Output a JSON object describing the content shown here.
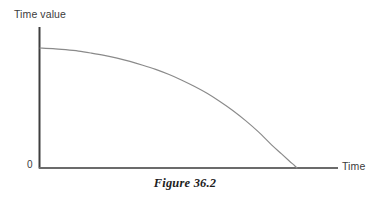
{
  "figure": {
    "caption": "Figure 36.2",
    "background_color": "#ffffff",
    "axis_color": "#4a4a4a",
    "curve_color": "#7a7a7a",
    "text_color": "#3b3b3b"
  },
  "chart_data": {
    "type": "line",
    "title": "",
    "subtitle": "",
    "xlabel": "Time",
    "ylabel": "Time value",
    "origin_label": "0",
    "grid": false,
    "legend": [],
    "legend_position": "none",
    "annotations": [],
    "xlim": [
      0,
      1
    ],
    "ylim": [
      0,
      1
    ],
    "x_tick_labels": [],
    "y_tick_labels": [
      "0"
    ],
    "series": [
      {
        "name": "time value decay",
        "description": "Concave-down curve starting at a high constant value, decaying slowly at first then falling steeply to zero at expiry.",
        "x": [
          0.0,
          0.05,
          0.1,
          0.15,
          0.2,
          0.25,
          0.3,
          0.35,
          0.4,
          0.45,
          0.5,
          0.55,
          0.6,
          0.65,
          0.7,
          0.75,
          0.8,
          0.85,
          0.9,
          0.94,
          0.97,
          0.99,
          1.0
        ],
        "y": [
          0.852,
          0.848,
          0.84,
          0.83,
          0.816,
          0.8,
          0.78,
          0.757,
          0.73,
          0.7,
          0.665,
          0.625,
          0.58,
          0.53,
          0.472,
          0.408,
          0.336,
          0.256,
          0.166,
          0.1,
          0.05,
          0.018,
          0.0
        ]
      }
    ]
  }
}
